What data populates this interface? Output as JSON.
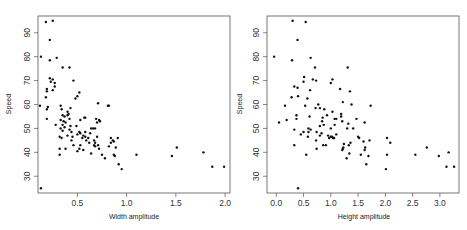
{
  "chart_data": [
    {
      "type": "scatter",
      "title": "",
      "xlabel": "Width amplitude",
      "ylabel": "Speed",
      "xlim": [
        0.1,
        2.05
      ],
      "ylim": [
        23,
        97
      ],
      "xticks": [
        0.5,
        1.0,
        1.5,
        2.0
      ],
      "xtick_labels": [
        "0.5",
        "1.0",
        "1.5",
        "2.0"
      ],
      "yticks": [
        30,
        40,
        50,
        60,
        70,
        80,
        90
      ],
      "ytick_labels": [
        "30",
        "40",
        "50",
        "60",
        "70",
        "80",
        "90"
      ],
      "grid": false,
      "legend": null,
      "points": [
        [
          0.18,
          94.5
        ],
        [
          0.25,
          95.0
        ],
        [
          0.22,
          87.0
        ],
        [
          0.13,
          80.0
        ],
        [
          0.22,
          78.5
        ],
        [
          0.29,
          79.5
        ],
        [
          0.35,
          75.5
        ],
        [
          0.42,
          75.5
        ],
        [
          0.22,
          71.0
        ],
        [
          0.25,
          70.5
        ],
        [
          0.27,
          69.0
        ],
        [
          0.23,
          69.5
        ],
        [
          0.46,
          70.0
        ],
        [
          0.27,
          67.5
        ],
        [
          0.19,
          66.5
        ],
        [
          0.25,
          66.0
        ],
        [
          0.19,
          65.5
        ],
        [
          0.52,
          65.0
        ],
        [
          0.18,
          63.0
        ],
        [
          0.5,
          63.5
        ],
        [
          0.48,
          62.5
        ],
        [
          0.12,
          59.5
        ],
        [
          0.2,
          59.0
        ],
        [
          0.19,
          58.0
        ],
        [
          0.33,
          59.5
        ],
        [
          0.34,
          58.0
        ],
        [
          0.71,
          60.5
        ],
        [
          0.81,
          59.5
        ],
        [
          0.82,
          59.5
        ],
        [
          0.43,
          58.5
        ],
        [
          0.4,
          57.0
        ],
        [
          0.41,
          56.0
        ],
        [
          0.4,
          55.5
        ],
        [
          0.35,
          55.5
        ],
        [
          0.37,
          55.0
        ],
        [
          0.19,
          54.0
        ],
        [
          0.33,
          53.5
        ],
        [
          0.36,
          53.0
        ],
        [
          0.38,
          52.5
        ],
        [
          0.42,
          54.0
        ],
        [
          0.53,
          53.5
        ],
        [
          0.57,
          54.5
        ],
        [
          0.58,
          54.5
        ],
        [
          0.69,
          54.0
        ],
        [
          0.7,
          52.5
        ],
        [
          0.72,
          53.5
        ],
        [
          0.73,
          53.0
        ],
        [
          0.28,
          51.5
        ],
        [
          0.35,
          51.5
        ],
        [
          0.43,
          51.0
        ],
        [
          0.49,
          51.0
        ],
        [
          0.37,
          50.5
        ],
        [
          0.33,
          50.0
        ],
        [
          0.42,
          49.5
        ],
        [
          0.64,
          50.0
        ],
        [
          0.66,
          50.0
        ],
        [
          0.68,
          50.0
        ],
        [
          0.35,
          49.0
        ],
        [
          0.44,
          48.5
        ],
        [
          0.52,
          48.5
        ],
        [
          0.53,
          48.0
        ],
        [
          0.58,
          48.5
        ],
        [
          0.63,
          48.0
        ],
        [
          0.5,
          47.5
        ],
        [
          0.4,
          47.0
        ],
        [
          0.56,
          47.0
        ],
        [
          0.58,
          46.5
        ],
        [
          0.32,
          46.5
        ],
        [
          0.34,
          46.0
        ],
        [
          0.45,
          46.5
        ],
        [
          0.55,
          46.0
        ],
        [
          0.61,
          46.0
        ],
        [
          0.7,
          46.5
        ],
        [
          0.84,
          46.0
        ],
        [
          0.91,
          46.0
        ],
        [
          0.44,
          45.0
        ],
        [
          0.59,
          45.0
        ],
        [
          0.67,
          45.0
        ],
        [
          0.86,
          45.0
        ],
        [
          0.87,
          44.5
        ],
        [
          0.84,
          44.0
        ],
        [
          0.62,
          44.0
        ],
        [
          0.68,
          44.0
        ],
        [
          0.46,
          43.0
        ],
        [
          0.53,
          43.0
        ],
        [
          0.67,
          43.0
        ],
        [
          0.71,
          43.0
        ],
        [
          0.68,
          42.5
        ],
        [
          0.82,
          42.5
        ],
        [
          0.89,
          42.0
        ],
        [
          0.72,
          41.5
        ],
        [
          0.32,
          41.5
        ],
        [
          0.38,
          41.5
        ],
        [
          0.52,
          41.5
        ],
        [
          0.56,
          41.0
        ],
        [
          0.5,
          40.5
        ],
        [
          0.32,
          39.0
        ],
        [
          0.64,
          39.5
        ],
        [
          0.75,
          39.0
        ],
        [
          0.87,
          39.0
        ],
        [
          0.88,
          38.5
        ],
        [
          0.78,
          37.5
        ],
        [
          0.92,
          35.0
        ],
        [
          0.95,
          33.0
        ],
        [
          1.1,
          39.0
        ],
        [
          1.46,
          38.5
        ],
        [
          1.51,
          42.0
        ],
        [
          1.78,
          40.0
        ],
        [
          1.87,
          34.0
        ],
        [
          1.99,
          34.0
        ],
        [
          0.13,
          25.0
        ]
      ]
    },
    {
      "type": "scatter",
      "title": "",
      "xlabel": "Height amplitude",
      "ylabel": "Speed",
      "xlim": [
        -0.17,
        3.35
      ],
      "ylim": [
        23,
        97
      ],
      "xticks": [
        0.0,
        0.5,
        1.0,
        1.5,
        2.0,
        2.5,
        3.0
      ],
      "xtick_labels": [
        "0.0",
        "0.5",
        "1.0",
        "1.5",
        "2.0",
        "2.5",
        "3.0"
      ],
      "yticks": [
        30,
        40,
        50,
        60,
        70,
        80,
        90
      ],
      "ytick_labels": [
        "30",
        "40",
        "50",
        "60",
        "70",
        "80",
        "90"
      ],
      "grid": false,
      "legend": null,
      "points": [
        [
          0.3,
          95.0
        ],
        [
          0.54,
          94.5
        ],
        [
          0.39,
          87.0
        ],
        [
          -0.04,
          80.0
        ],
        [
          0.29,
          78.5
        ],
        [
          0.63,
          79.5
        ],
        [
          0.71,
          75.5
        ],
        [
          1.31,
          75.5
        ],
        [
          0.51,
          71.5
        ],
        [
          0.67,
          70.5
        ],
        [
          0.73,
          70.0
        ],
        [
          1.03,
          70.5
        ],
        [
          1.0,
          69.0
        ],
        [
          0.5,
          69.5
        ],
        [
          0.33,
          67.5
        ],
        [
          0.39,
          67.0
        ],
        [
          1.17,
          66.5
        ],
        [
          0.62,
          66.0
        ],
        [
          1.35,
          65.5
        ],
        [
          0.4,
          63.5
        ],
        [
          0.28,
          63.0
        ],
        [
          0.57,
          62.5
        ],
        [
          1.22,
          61.0
        ],
        [
          0.16,
          59.5
        ],
        [
          0.53,
          59.5
        ],
        [
          0.77,
          60.0
        ],
        [
          1.38,
          60.0
        ],
        [
          1.73,
          59.5
        ],
        [
          0.8,
          58.5
        ],
        [
          0.88,
          58.0
        ],
        [
          0.72,
          58.5
        ],
        [
          1.03,
          57.0
        ],
        [
          1.19,
          56.0
        ],
        [
          0.37,
          55.5
        ],
        [
          0.93,
          55.5
        ],
        [
          0.61,
          55.0
        ],
        [
          1.19,
          55.0
        ],
        [
          0.85,
          54.5
        ],
        [
          1.07,
          54.0
        ],
        [
          1.1,
          54.0
        ],
        [
          1.47,
          54.0
        ],
        [
          0.37,
          54.0
        ],
        [
          0.19,
          53.5
        ],
        [
          0.84,
          53.0
        ],
        [
          1.21,
          53.0
        ],
        [
          1.62,
          52.5
        ],
        [
          0.05,
          52.5
        ],
        [
          1.32,
          52.0
        ],
        [
          0.8,
          51.0
        ],
        [
          0.87,
          51.5
        ],
        [
          1.07,
          51.5
        ],
        [
          0.59,
          50.0
        ],
        [
          1.0,
          50.0
        ],
        [
          1.3,
          50.0
        ],
        [
          1.41,
          50.0
        ],
        [
          0.33,
          49.5
        ],
        [
          0.63,
          49.5
        ],
        [
          0.5,
          48.5
        ],
        [
          0.74,
          48.5
        ],
        [
          0.83,
          48.0
        ],
        [
          0.59,
          48.5
        ],
        [
          0.45,
          47.5
        ],
        [
          1.1,
          47.5
        ],
        [
          0.8,
          47.0
        ],
        [
          0.95,
          47.0
        ],
        [
          1.0,
          46.5
        ],
        [
          1.02,
          46.5
        ],
        [
          1.04,
          46.0
        ],
        [
          1.06,
          46.0
        ],
        [
          1.5,
          46.5
        ],
        [
          1.52,
          46.0
        ],
        [
          2.03,
          46.0
        ],
        [
          0.58,
          46.5
        ],
        [
          0.97,
          46.0
        ],
        [
          1.05,
          46.0
        ],
        [
          0.73,
          45.0
        ],
        [
          1.71,
          45.0
        ],
        [
          1.6,
          44.5
        ],
        [
          2.09,
          44.0
        ],
        [
          1.36,
          44.0
        ],
        [
          1.24,
          43.5
        ],
        [
          0.86,
          43.0
        ],
        [
          0.33,
          43.0
        ],
        [
          0.91,
          43.0
        ],
        [
          1.33,
          43.0
        ],
        [
          1.63,
          42.0
        ],
        [
          1.23,
          42.0
        ],
        [
          1.22,
          41.5
        ],
        [
          1.62,
          41.0
        ],
        [
          1.21,
          41.0
        ],
        [
          0.74,
          41.5
        ],
        [
          1.34,
          39.5
        ],
        [
          1.55,
          39.0
        ],
        [
          1.69,
          38.5
        ],
        [
          1.29,
          37.5
        ],
        [
          2.03,
          39.0
        ],
        [
          0.55,
          39.0
        ],
        [
          2.55,
          39.0
        ],
        [
          2.76,
          42.0
        ],
        [
          2.98,
          38.5
        ],
        [
          3.16,
          40.0
        ],
        [
          1.65,
          35.0
        ],
        [
          2.01,
          33.0
        ],
        [
          3.12,
          34.0
        ],
        [
          3.26,
          34.0
        ],
        [
          0.4,
          25.0
        ]
      ]
    }
  ],
  "plots": [
    {
      "xlabel": "Width amplitude",
      "ylabel": "Speed"
    },
    {
      "xlabel": "Height amplitude",
      "ylabel": "Speed"
    }
  ]
}
